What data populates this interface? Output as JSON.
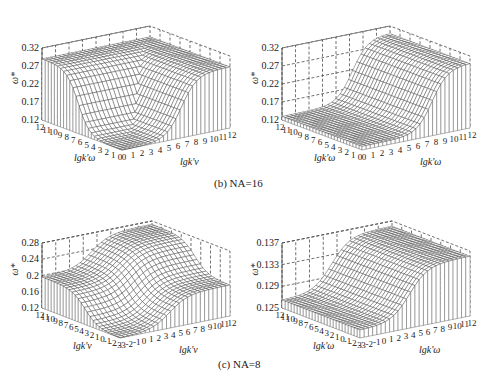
{
  "figure": {
    "captions": {
      "b": "(b) NA=16",
      "c": "(c) NA=8"
    }
  },
  "chart_data": [
    {
      "id": "b-left",
      "type": "surface3d",
      "group": "(b) NA=16",
      "title": "",
      "zlabel": "ω*",
      "xlabel": "lgk'ω",
      "ylabel": "lgk'v",
      "zticks": [
        "0.12",
        "0.17",
        "0.22",
        "0.27",
        "0.32"
      ],
      "zlim": [
        0.12,
        0.32
      ],
      "x_ticks": [
        "12",
        "11",
        "10",
        "9",
        "8",
        "7",
        "6",
        "5",
        "4",
        "3",
        "2",
        "1",
        "0"
      ],
      "y_ticks": [
        "0",
        "1",
        "2",
        "3",
        "4",
        "5",
        "6",
        "7",
        "8",
        "9",
        "10",
        "11",
        "12"
      ],
      "description": "High plateau (~0.29) along far edges on both axes, dropping through a smooth transition near lgk' ≈ 4-6 to a low floor (~0.12) in the corner near origin",
      "plateau_value": 0.29,
      "floor_value": 0.12
    },
    {
      "id": "b-right",
      "type": "surface3d",
      "group": "(b) NA=16",
      "title": "",
      "zlabel": "ω*",
      "xlabel": "lgk'ω",
      "ylabel": "lgk'ω",
      "zticks": [
        "0.12",
        "0.17",
        "0.22",
        "0.27",
        "0.32"
      ],
      "zlim": [
        0.12,
        0.32
      ],
      "x_ticks": [
        "12",
        "11",
        "10",
        "9",
        "8",
        "7",
        "6",
        "5",
        "4",
        "3",
        "2",
        "1",
        "0"
      ],
      "y_ticks": [
        "0",
        "1",
        "2",
        "3",
        "4",
        "5",
        "6",
        "7",
        "8",
        "9",
        "10",
        "11",
        "12"
      ],
      "description": "Flat floor (~0.13) over most of domain; rises to ~0.30 plateau along one axis for lgk' > ~8",
      "plateau_value": 0.3,
      "floor_value": 0.13
    },
    {
      "id": "c-left",
      "type": "surface3d",
      "group": "(c) NA=8",
      "title": "",
      "zlabel": "ω*",
      "xlabel": "lgk'v",
      "ylabel": "lgk'v",
      "zticks": [
        "0.12",
        "0.16",
        "0.2",
        "0.24",
        "0.28"
      ],
      "zlim": [
        0.12,
        0.28
      ],
      "x_ticks": [
        "12",
        "11",
        "10",
        "9",
        "8",
        "7",
        "6",
        "5",
        "4",
        "3",
        "2",
        "1",
        "0",
        "-1",
        "-2",
        "-3"
      ],
      "y_ticks": [
        "-3",
        "-2",
        "-1",
        "0",
        "1",
        "2",
        "3",
        "4",
        "5",
        "6",
        "7",
        "8",
        "9",
        "10",
        "11",
        "12"
      ],
      "description": "Saddle-like: corner plateaus ~0.20, rising to ~0.29 ridge at far corner, dropping to ~0.12 at near corner; sigmoid transitions around lgk' ≈ 2-5",
      "plateau_value": 0.2,
      "peak_value": 0.29,
      "floor_value": 0.12
    },
    {
      "id": "c-right",
      "type": "surface3d",
      "group": "(c) NA=8",
      "title": "",
      "zlabel": "ω*",
      "xlabel": "lgk'ω",
      "ylabel": "lgk'ω",
      "zticks": [
        "0.125",
        "0.129",
        "0.133",
        "0.137"
      ],
      "zlim": [
        0.125,
        0.139
      ],
      "x_ticks": [
        "12",
        "11",
        "10",
        "9",
        "8",
        "7",
        "6",
        "5",
        "4",
        "3",
        "2",
        "1",
        "0",
        "-1",
        "-2",
        "-3"
      ],
      "y_ticks": [
        "-3",
        "-2",
        "-1",
        "0",
        "1",
        "2",
        "3",
        "4",
        "5",
        "6",
        "7",
        "8",
        "9",
        "10",
        "11",
        "12"
      ],
      "description": "Flat floor (~0.127) over most of domain; rises to ~0.138 plateau along one axis for lgk' > ~4",
      "plateau_value": 0.138,
      "floor_value": 0.127
    }
  ]
}
